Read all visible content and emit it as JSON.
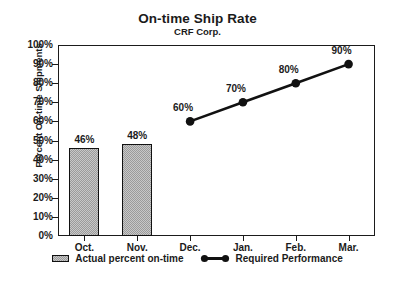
{
  "chart_data": {
    "type": "bar",
    "title": "On-time Ship Rate",
    "subtitle": "CRF Corp.",
    "xlabel": "",
    "ylabel": "Percent On-time Shipments",
    "categories": [
      "Oct.",
      "Nov.",
      "Dec.",
      "Jan.",
      "Feb.",
      "Mar."
    ],
    "ylim": [
      0,
      100
    ],
    "yticks": [
      "0%",
      "10%",
      "20%",
      "30%",
      "40%",
      "50%",
      "60%",
      "70%",
      "80%",
      "90%",
      "100%"
    ],
    "ytick_values": [
      0,
      10,
      20,
      30,
      40,
      50,
      60,
      70,
      80,
      90,
      100
    ],
    "grid": false,
    "legend_position": "bottom",
    "series": [
      {
        "name": "Actual percent on-time",
        "type": "bar",
        "color": "#9b9b9b",
        "edge_color": "#111111",
        "values": [
          46,
          48,
          null,
          null,
          null,
          null
        ],
        "labels": [
          "46%",
          "48%",
          null,
          null,
          null,
          null
        ]
      },
      {
        "name": "Required Performance",
        "type": "line",
        "color": "#111111",
        "marker": "filled-circle",
        "values": [
          null,
          null,
          60,
          70,
          80,
          90
        ],
        "labels": [
          null,
          null,
          "60%",
          "70%",
          "80%",
          "90%"
        ]
      }
    ]
  },
  "legend": {
    "entries": [
      {
        "label": "Actual percent on-time",
        "icon": "bar-swatch-icon"
      },
      {
        "label": "Required Performance",
        "icon": "line-marker-icon"
      }
    ]
  }
}
